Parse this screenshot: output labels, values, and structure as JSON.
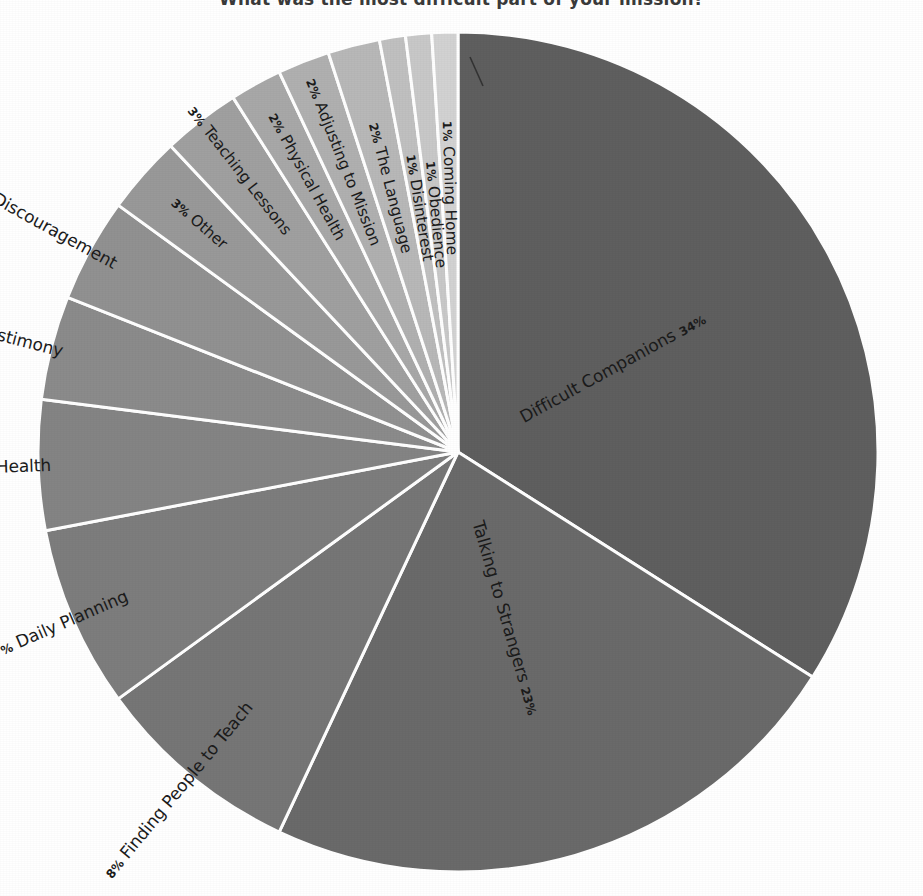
{
  "chart_data": {
    "type": "pie",
    "title": "What was the most difficult part of your mission?",
    "xlabel": "",
    "ylabel": "",
    "legend_position": "none",
    "grid": false,
    "labels_on_slices": true,
    "start_angle_deg": -90,
    "direction": "clockwise",
    "categories": [
      "Difficult Companions",
      "Talking to Strangers",
      "Finding People to Teach",
      "Daily Planning",
      "Mental Health",
      "Gaining a Testimony",
      "Rejection & Discouragement",
      "Other",
      "Teaching Lessons",
      "Physical Health",
      "Adjusting to Mission",
      "The Language",
      "Disinterest",
      "Obedience",
      "Coming Home"
    ],
    "values": [
      34,
      23,
      8,
      7,
      5,
      4,
      4,
      3,
      3,
      2,
      2,
      2,
      1,
      1,
      1
    ],
    "percent_labels": [
      "34%",
      "23%",
      "8%",
      "7%",
      "5%",
      "4%",
      "4%",
      "3%",
      "3%",
      "2%",
      "2%",
      "2%",
      "1%",
      "1%",
      "1%"
    ],
    "slice_colors": [
      "#5f5f5f",
      "#6a6a6a",
      "#767676",
      "#7d7d7d",
      "#848484",
      "#8b8b8b",
      "#919191",
      "#999999",
      "#a0a0a0",
      "#a8a8a8",
      "#b0b0b0",
      "#b8b8b8",
      "#c0c0c0",
      "#c8c8c8",
      "#d2d2d2"
    ],
    "slice_separator_color": "#ffffff",
    "background_color": "#ffffff",
    "text_color": "#1b1b1b"
  },
  "chart": {
    "title": "What was the most difficult part of your mission?",
    "slices": [
      {
        "label": "Difficult Companions",
        "pct": "34%",
        "value": 34
      },
      {
        "label": "Talking to Strangers",
        "pct": "23%",
        "value": 23
      },
      {
        "label": "Finding People to Teach",
        "pct": "8%",
        "value": 8
      },
      {
        "label": "Daily Planning",
        "pct": "7%",
        "value": 7
      },
      {
        "label": "Mental Health",
        "pct": "5%",
        "value": 5
      },
      {
        "label": "Gaining a Testimony",
        "pct": "4%",
        "value": 4
      },
      {
        "label": "Rejection & Discouragement",
        "pct": "4%",
        "value": 4
      },
      {
        "label": "Other",
        "pct": "3%",
        "value": 3
      },
      {
        "label": "Teaching Lessons",
        "pct": "3%",
        "value": 3
      },
      {
        "label": "Physical Health",
        "pct": "2%",
        "value": 2
      },
      {
        "label": "Adjusting to Mission",
        "pct": "2%",
        "value": 2
      },
      {
        "label": "The Language",
        "pct": "2%",
        "value": 2
      },
      {
        "label": "Disinterest",
        "pct": "1%",
        "value": 1
      },
      {
        "label": "Obedience",
        "pct": "1%",
        "value": 1
      },
      {
        "label": "Coming Home",
        "pct": "1%",
        "value": 1
      }
    ]
  }
}
